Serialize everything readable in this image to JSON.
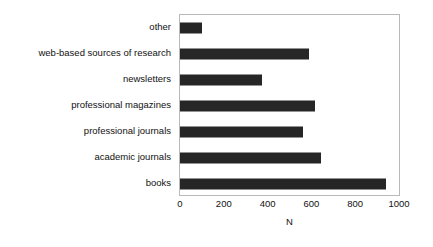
{
  "chart_data": {
    "type": "bar",
    "orientation": "horizontal",
    "title": "",
    "xlabel": "N",
    "ylabel": "",
    "xlim": [
      0,
      1000
    ],
    "xticks": [
      0,
      200,
      400,
      600,
      800,
      1000
    ],
    "xtick_labels": [
      "0",
      "200",
      "400",
      "600",
      "800",
      "1000"
    ],
    "grid": false,
    "legend": null,
    "bar_color": "#262626",
    "categories": [
      "other",
      "web-based sources of research",
      "newsletters",
      "professional magazines",
      "professional journals",
      "academic journals",
      "books"
    ],
    "values": [
      100,
      590,
      375,
      615,
      560,
      645,
      940
    ]
  }
}
